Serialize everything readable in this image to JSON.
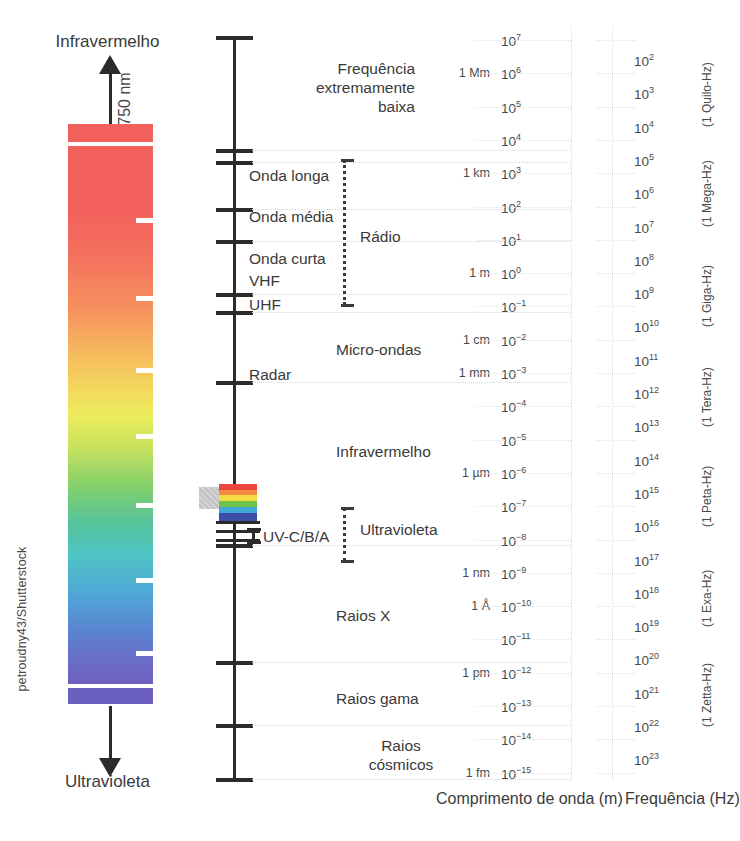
{
  "credit": "petroudny43/Shutterstock",
  "visible_panel": {
    "top_label": "Infravermelho",
    "bottom_label": "Ultravioleta",
    "wavelength_note": "750 nm"
  },
  "axis_titles": {
    "wavelength": "Comprimento de onda (m)",
    "frequency": "Frequência (Hz)"
  },
  "bands": [
    {
      "name": "elf",
      "label": "Frequência\nextremamente\nbaixa"
    },
    {
      "name": "radio",
      "label": "Rádio"
    },
    {
      "name": "microwave",
      "label": "Micro-ondas"
    },
    {
      "name": "infrared",
      "label": "Infravermelho"
    },
    {
      "name": "ultraviolet",
      "label": "Ultravioleta"
    },
    {
      "name": "xray",
      "label": "Raios X"
    },
    {
      "name": "gamma",
      "label": "Raios gama"
    },
    {
      "name": "cosmic",
      "label": "Raios\ncósmicos"
    }
  ],
  "sub_bands": [
    {
      "name": "long-wave",
      "label": "Onda longa"
    },
    {
      "name": "medium-wave",
      "label": "Onda média"
    },
    {
      "name": "short-wave",
      "label": "Onda curta"
    },
    {
      "name": "vhf",
      "label": "VHF"
    },
    {
      "name": "uhf",
      "label": "UHF"
    },
    {
      "name": "radar",
      "label": "Radar"
    },
    {
      "name": "uv-cba",
      "label": "UV-C/B/A"
    }
  ],
  "chart_data": {
    "type": "table",
    "xlabel": "",
    "ylabel": "",
    "wavelength_axis": {
      "label": "Comprimento de onda (m)",
      "exponents": [
        7,
        6,
        5,
        4,
        3,
        2,
        1,
        0,
        -1,
        -2,
        -3,
        -4,
        -5,
        -6,
        -7,
        -8,
        -9,
        -10,
        -11,
        -12,
        -13,
        -14,
        -15
      ],
      "unit_marks": [
        {
          "exp": 6,
          "text": "1 Mm"
        },
        {
          "exp": 3,
          "text": "1 km"
        },
        {
          "exp": 0,
          "text": "1 m"
        },
        {
          "exp": -2,
          "text": "1 cm"
        },
        {
          "exp": -3,
          "text": "1 mm"
        },
        {
          "exp": -6,
          "text": "1 µm"
        },
        {
          "exp": -9,
          "text": "1 nm"
        },
        {
          "exp": -10,
          "text": "1 Å"
        },
        {
          "exp": -12,
          "text": "1 pm"
        },
        {
          "exp": -15,
          "text": "1 fm"
        }
      ]
    },
    "frequency_axis": {
      "label": "Frequência (Hz)",
      "exponents": [
        2,
        3,
        4,
        5,
        6,
        7,
        8,
        9,
        10,
        11,
        12,
        13,
        14,
        15,
        16,
        17,
        18,
        19,
        20,
        21,
        22,
        23
      ],
      "unit_marks": [
        {
          "exp": 3,
          "text": "(1 Quilo-Hz)"
        },
        {
          "exp": 6,
          "text": "(1 Mega-Hz)"
        },
        {
          "exp": 9,
          "text": "(1 Giga-Hz)"
        },
        {
          "exp": 12,
          "text": "(1 Tera-Hz)"
        },
        {
          "exp": 15,
          "text": "(1 Peta-Hz)"
        },
        {
          "exp": 18,
          "text": "(1 Exa-Hz)"
        },
        {
          "exp": 21,
          "text": "(1 Zetta-Hz)"
        }
      ]
    },
    "visible_spectrum_colors": [
      "#f2615c",
      "#f68f5e",
      "#ecec5c",
      "#86d06b",
      "#4fc4c4",
      "#5a85d0",
      "#6f5fbe"
    ]
  },
  "colors": {
    "ink": "#3a3a3a",
    "axis": "#2b2b2b",
    "grid": "#dcdcdc"
  }
}
